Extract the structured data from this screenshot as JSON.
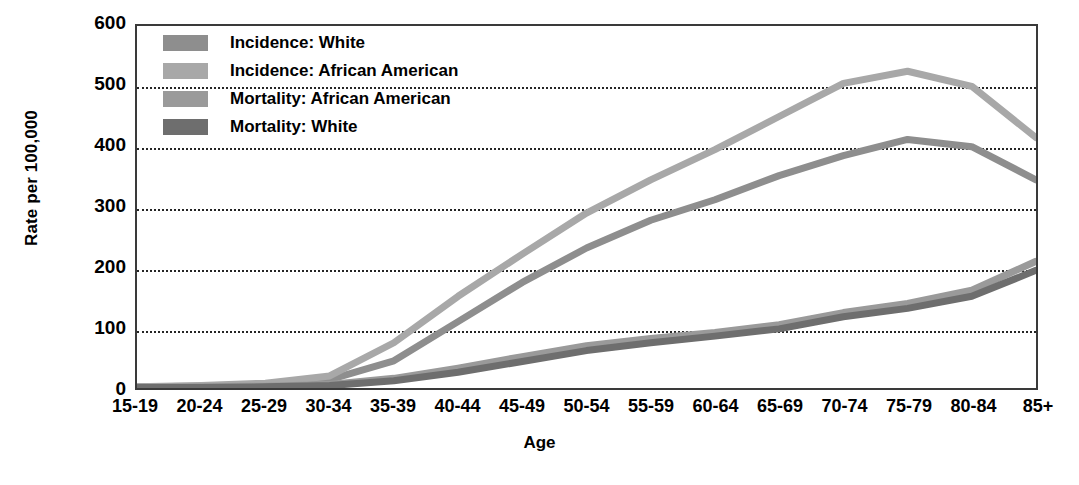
{
  "chart_data": {
    "type": "line",
    "title": "",
    "xlabel": "Age",
    "ylabel": "Rate per 100,000",
    "categories": [
      "15-19",
      "20-24",
      "25-29",
      "30-34",
      "35-39",
      "40-44",
      "45-49",
      "50-54",
      "55-59",
      "60-64",
      "65-69",
      "70-74",
      "75-79",
      "80-84",
      "85+"
    ],
    "ylim": [
      0,
      600
    ],
    "yticks": [
      0,
      100,
      200,
      300,
      400,
      500,
      600
    ],
    "ytick_labels": [
      "0",
      "100",
      "200",
      "300",
      "400",
      "500",
      "600"
    ],
    "grid": "horizontal-dotted",
    "legend_position": "top-left-inside",
    "series": [
      {
        "name": "Incidence: White",
        "color": "#8e8e8e",
        "values": [
          2,
          3,
          6,
          14,
          45,
          110,
          175,
          232,
          278,
          312,
          352,
          385,
          412,
          400,
          345
        ]
      },
      {
        "name": "Incidence: African American",
        "color": "#a8a8a8",
        "values": [
          2,
          4,
          8,
          20,
          75,
          152,
          222,
          290,
          345,
          395,
          450,
          505,
          525,
          500,
          415
        ]
      },
      {
        "name": "Mortality: African American",
        "color": "#9a9a9a",
        "values": [
          1,
          2,
          3,
          6,
          16,
          33,
          52,
          70,
          82,
          92,
          105,
          125,
          140,
          162,
          210
        ]
      },
      {
        "name": "Mortality: White",
        "color": "#6e6e6e",
        "values": [
          1,
          1,
          2,
          4,
          12,
          26,
          44,
          62,
          75,
          86,
          98,
          118,
          132,
          152,
          195
        ]
      }
    ]
  },
  "legend": {
    "items": [
      {
        "label": "Incidence: White",
        "swatch": "#8e8e8e"
      },
      {
        "label": "Incidence: African American",
        "swatch": "#a8a8a8"
      },
      {
        "label": "Mortality: African American",
        "swatch": "#9a9a9a"
      },
      {
        "label": "Mortality: White",
        "swatch": "#6e6e6e"
      }
    ]
  }
}
